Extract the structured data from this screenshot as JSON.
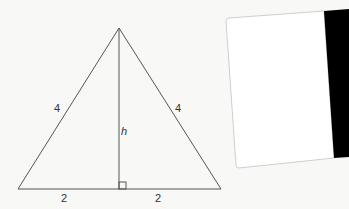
{
  "diagram": {
    "shape": "isosceles-triangle",
    "labels": {
      "left_side": "4",
      "right_side": "4",
      "height": "h",
      "base_left_half": "2",
      "base_right_half": "2"
    },
    "colors": {
      "background": "#f8f8f6",
      "line": "#555555",
      "card": "#ffffff",
      "card_border": "#cfcfcf",
      "strip": "#000000"
    }
  }
}
